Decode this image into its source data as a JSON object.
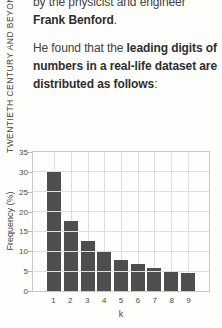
{
  "sidebar": {
    "label": "TWENTIETH CENTURY AND BEYOND"
  },
  "intro": {
    "p1": {
      "seg0": "by the physicist and engineer ",
      "seg1": "Frank Benford",
      "seg2": "."
    },
    "p2": {
      "seg0": "He found that the ",
      "seg1": "leading digits of numbers in a real-life dataset are distributed as follows",
      "seg2": ":"
    }
  },
  "chart_data": {
    "type": "bar",
    "categories": [
      "1",
      "2",
      "3",
      "4",
      "5",
      "6",
      "7",
      "8",
      "9"
    ],
    "values": [
      30.1,
      17.6,
      12.5,
      9.7,
      7.9,
      6.7,
      5.8,
      5.1,
      4.6
    ],
    "title": "",
    "xlabel": "k",
    "ylabel": "Frequency (%)",
    "ylim": [
      0,
      35
    ],
    "yticks": [
      0,
      5,
      10,
      15,
      20,
      25,
      30,
      35
    ],
    "grid": "both",
    "legend_position": "none",
    "colors": {
      "bar": "#4e4e4e",
      "gridline": "#dedede",
      "plot_border": "#c9c9c9",
      "text": "#424242"
    }
  }
}
